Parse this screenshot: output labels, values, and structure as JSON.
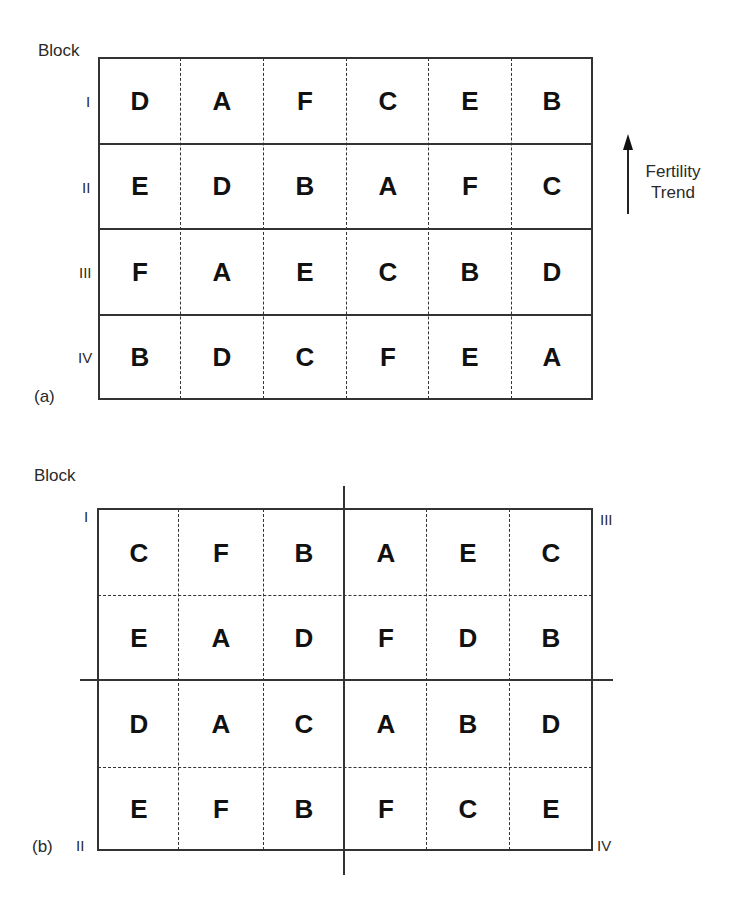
{
  "panel_a": {
    "caption": "(a)",
    "header_label": "Block",
    "block_labels": [
      "I",
      "II",
      "III",
      "IV"
    ],
    "rows": [
      [
        "D",
        "A",
        "F",
        "C",
        "E",
        "B"
      ],
      [
        "E",
        "D",
        "B",
        "A",
        "F",
        "C"
      ],
      [
        "F",
        "A",
        "E",
        "C",
        "B",
        "D"
      ],
      [
        "B",
        "D",
        "C",
        "F",
        "E",
        "A"
      ]
    ],
    "trend": {
      "line1": "Fertility",
      "line2": "Trend",
      "direction": "up"
    }
  },
  "panel_b": {
    "caption": "(b)",
    "header_label": "Block",
    "corner_labels": {
      "top_left": "I",
      "top_right": "III",
      "bottom_left": "II",
      "bottom_right": "IV"
    },
    "rows": [
      [
        "C",
        "F",
        "B",
        "A",
        "E",
        "C"
      ],
      [
        "E",
        "A",
        "D",
        "F",
        "D",
        "B"
      ],
      [
        "D",
        "A",
        "C",
        "A",
        "B",
        "D"
      ],
      [
        "E",
        "F",
        "B",
        "F",
        "C",
        "E"
      ]
    ],
    "blocks": {
      "I": [
        [
          "C",
          "F",
          "B"
        ],
        [
          "E",
          "A",
          "D"
        ]
      ],
      "III": [
        [
          "A",
          "E",
          "C"
        ],
        [
          "F",
          "D",
          "B"
        ]
      ],
      "II": [
        [
          "D",
          "A",
          "C"
        ],
        [
          "E",
          "F",
          "B"
        ]
      ],
      "IV": [
        [
          "A",
          "B",
          "D"
        ],
        [
          "F",
          "C",
          "E"
        ]
      ]
    }
  }
}
